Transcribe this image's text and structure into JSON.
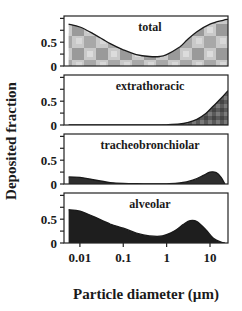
{
  "chart_data": {
    "type": "area",
    "layout": "4 vertically stacked panels sharing a log-scale x axis",
    "xlabel": "Particle diameter (µm)",
    "ylabel": "Deposited fraction",
    "xscale": "log",
    "xlim": [
      0.0043,
      26
    ],
    "xticks": [
      0.01,
      0.1,
      1,
      10
    ],
    "xtick_labels": [
      "0.01",
      "0.1",
      "1",
      "10"
    ],
    "ylim": [
      0,
      1.05
    ],
    "yticks": [
      0,
      0.25,
      0.5,
      0.75,
      1.0
    ],
    "ytick_labels": [
      "0",
      "",
      "0.5",
      "",
      ""
    ],
    "grid": false,
    "legend": null,
    "panels": [
      {
        "title": "total",
        "fill": "checkered-gray",
        "x": [
          0.0055,
          0.01,
          0.02,
          0.05,
          0.1,
          0.2,
          0.4,
          0.7,
          1,
          2,
          3,
          5,
          10,
          20,
          26
        ],
        "y": [
          0.88,
          0.82,
          0.68,
          0.47,
          0.34,
          0.24,
          0.2,
          0.2,
          0.24,
          0.4,
          0.55,
          0.72,
          0.88,
          0.96,
          0.98
        ]
      },
      {
        "title": "extrathoracic",
        "fill": "dark-gray",
        "x": [
          0.0055,
          0.1,
          0.5,
          1,
          2,
          3,
          5,
          8,
          12,
          18,
          26
        ],
        "y": [
          0.0,
          0.0,
          0.0,
          0.005,
          0.02,
          0.05,
          0.12,
          0.24,
          0.4,
          0.56,
          0.72
        ]
      },
      {
        "title": "tracheobronchiolar",
        "fill": "very-dark-gray",
        "x": [
          0.0055,
          0.01,
          0.02,
          0.05,
          0.1,
          0.3,
          1,
          2,
          4,
          7,
          10,
          14,
          18,
          22
        ],
        "y": [
          0.15,
          0.14,
          0.09,
          0.03,
          0.01,
          0.005,
          0.005,
          0.02,
          0.08,
          0.18,
          0.25,
          0.24,
          0.14,
          0.0
        ]
      },
      {
        "title": "alveolar",
        "fill": "black",
        "x": [
          0.0055,
          0.01,
          0.02,
          0.05,
          0.1,
          0.2,
          0.4,
          0.8,
          1.5,
          2.5,
          3.5,
          5,
          8,
          12,
          18,
          22
        ],
        "y": [
          0.7,
          0.67,
          0.56,
          0.4,
          0.31,
          0.21,
          0.15,
          0.15,
          0.25,
          0.4,
          0.47,
          0.45,
          0.28,
          0.1,
          0.02,
          0.0
        ]
      }
    ]
  }
}
